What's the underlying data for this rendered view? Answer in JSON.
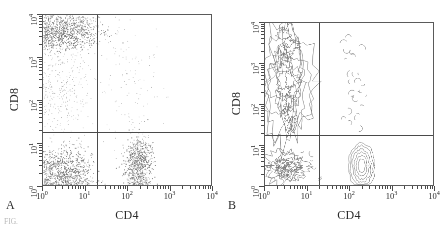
{
  "figure": {
    "panels": [
      {
        "letter": "A",
        "plot_type": "dot",
        "xlabel": "CD4",
        "ylabel": "CD8"
      },
      {
        "letter": "B",
        "plot_type": "contour",
        "xlabel": "CD4",
        "ylabel": "CD8"
      }
    ],
    "caption_fragment": "FIG."
  },
  "axis": {
    "x_tick_labels": [
      "10",
      "10",
      "10",
      "10",
      "10"
    ],
    "x_tick_exponents": [
      "0",
      "1",
      "2",
      "3",
      "4"
    ],
    "y_tick_labels": [
      "10",
      "10",
      "10",
      "10",
      "10"
    ],
    "y_tick_exponents": [
      "0",
      "1",
      "2",
      "3",
      "4"
    ]
  },
  "colors": {
    "frame": "#5a5a5a",
    "gate_line": "#4a4a4a",
    "dot": "#8c8c8c",
    "dot_dense": "#6f6f6f",
    "contour": "#7a7a7a",
    "text": "#2b2b2b",
    "background": "#ffffff"
  },
  "chart_data": {
    "type": "scatter",
    "title": "",
    "xlabel": "CD4",
    "ylabel": "CD8",
    "xscale": "log",
    "yscale": "log",
    "xlim": [
      1,
      10000
    ],
    "ylim": [
      1,
      10000
    ],
    "grid": false,
    "legend": false,
    "xtick_values": [
      1,
      10,
      100,
      1000,
      10000
    ],
    "ytick_values": [
      1,
      10,
      100,
      1000,
      10000
    ],
    "gates": {
      "x_divider": 18,
      "y_divider": 14
    },
    "panels": [
      {
        "letter": "A",
        "type": "scatter",
        "populations": [
          {
            "name": "CD8 single positive",
            "quadrant": "upper-left",
            "x_center": 3.5,
            "y_center": 4000,
            "x_spread_log": 0.42,
            "y_spread_log": 0.22,
            "n_points": 900,
            "density": "high"
          },
          {
            "name": "CD8 intermediate tail",
            "quadrant": "upper-left",
            "x_center": 3.0,
            "y_center": 200,
            "x_spread_log": 0.38,
            "y_spread_log": 0.62,
            "n_points": 320,
            "density": "low"
          },
          {
            "name": "Double negative",
            "quadrant": "lower-left",
            "x_center": 3.2,
            "y_center": 2.2,
            "x_spread_log": 0.34,
            "y_spread_log": 0.28,
            "n_points": 820,
            "density": "high"
          },
          {
            "name": "CD4 single positive",
            "quadrant": "lower-right",
            "x_center": 190,
            "y_center": 3.2,
            "x_spread_log": 0.17,
            "y_spread_log": 0.34,
            "n_points": 700,
            "density": "high"
          },
          {
            "name": "CD4/CD8 double positive sparse",
            "quadrant": "upper-right",
            "x_center": 110,
            "y_center": 300,
            "x_spread_log": 0.38,
            "y_spread_log": 0.85,
            "n_points": 120,
            "density": "low"
          }
        ]
      },
      {
        "letter": "B",
        "type": "contour",
        "populations": [
          {
            "name": "CD8 single positive",
            "quadrant": "upper-left",
            "x_center": 3.5,
            "y_center": 2500,
            "contour_levels": 5
          },
          {
            "name": "Double negative",
            "quadrant": "lower-left",
            "x_center": 3.2,
            "y_center": 2.6,
            "contour_levels": 4
          },
          {
            "name": "CD4 single positive",
            "quadrant": "lower-right",
            "x_center": 200,
            "y_center": 3.0,
            "contour_levels": 5
          },
          {
            "name": "CD4/CD8 double positive sparse",
            "quadrant": "upper-right",
            "x_center": 110,
            "y_center": 300,
            "contour_levels": 1
          }
        ]
      }
    ]
  }
}
